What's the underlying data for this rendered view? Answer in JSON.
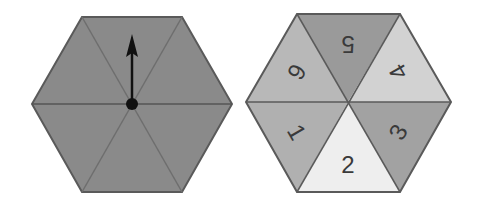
{
  "figure": {
    "spinner": {
      "pointer": "arrow-icon",
      "pointer_direction": "up",
      "fill_color": "#8a8a8a",
      "edge_color": "#5a5a5a"
    },
    "number_hexagon": {
      "sectors": [
        {
          "label": "5",
          "position": "top",
          "color": "#9a9a9a"
        },
        {
          "label": "4",
          "position": "upper-right",
          "color": "#d2d2d2"
        },
        {
          "label": "3",
          "position": "lower-right",
          "color": "#a2a2a2"
        },
        {
          "label": "2",
          "position": "bottom",
          "color": "#eeeeee"
        },
        {
          "label": "1",
          "position": "lower-left",
          "color": "#b0b0b0"
        },
        {
          "label": "6",
          "position": "upper-left",
          "color": "#b8b8b8"
        }
      ],
      "edge_color": "#5a5a5a"
    }
  }
}
